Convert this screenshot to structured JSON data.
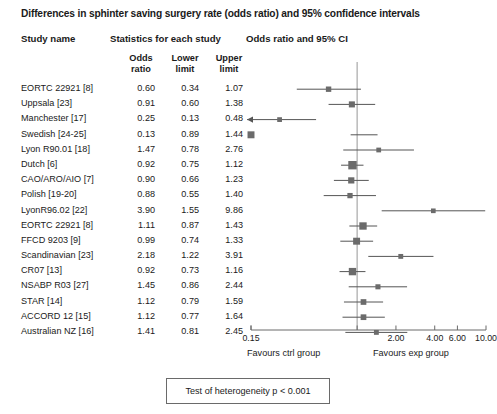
{
  "title": "Differences in sphinter saving surgery rate (odds ratio) and 95% confidence intervals",
  "headers": {
    "study_name": "Study name",
    "statistics": "Statistics for each study",
    "odds_ratio_ci": "Odds ratio and 95% CI",
    "odds_ratio": "Odds\nratio",
    "odds_ratio_l1": "Odds",
    "odds_ratio_l2": "ratio",
    "lower_limit_l1": "Lower",
    "lower_limit_l2": "limit",
    "upper_limit_l1": "Upper",
    "upper_limit_l2": "limit"
  },
  "axis": {
    "tick_labels": [
      "0.15",
      "1.00",
      "2.00",
      "4.00",
      "6.00",
      "10.00"
    ],
    "tick_values": [
      0.15,
      1.0,
      2.0,
      4.0,
      6.0,
      10.0
    ],
    "visible_tick_labels": [
      "0.15",
      "2.00",
      "4.00",
      "6.00",
      "10.00"
    ],
    "min": 0.15,
    "max": 10.0,
    "reference_line": 1.0,
    "favours_left": "Favours ctrl group",
    "favours_right": "Favours exp group"
  },
  "heterogeneity": {
    "text": "Test of heterogeneity p < 0.001"
  },
  "colors": {
    "marker": "#6b6b6b",
    "line": "#555555",
    "axis": "#6a6a6a",
    "reference": "#b5b5b5",
    "text": "#1a1a1a",
    "box_border": "#6a6a6a"
  },
  "chart_data": {
    "type": "forest",
    "title": "Differences in sphinter saving surgery rate (odds ratio) and 95% confidence intervals",
    "xlabel": "Odds ratio and 95% CI",
    "ylabel": "",
    "xscale": "log",
    "xlim": [
      0.15,
      10.0
    ],
    "reference_line": 1.0,
    "grid": false,
    "columns": [
      "Study name",
      "Odds ratio",
      "Lower limit",
      "Upper limit"
    ],
    "rows": [
      {
        "study": "EORTC 22921 [8]",
        "or": 0.6,
        "lower": 0.34,
        "upper": 1.07,
        "weight": 0.42,
        "clipped_left": false
      },
      {
        "study": "Uppsala [23]",
        "or": 0.91,
        "lower": 0.6,
        "upper": 1.38,
        "weight": 0.55,
        "clipped_left": false
      },
      {
        "study": "Manchester [17]",
        "or": 0.25,
        "lower": 0.13,
        "upper": 0.48,
        "weight": 0.3,
        "clipped_left": true
      },
      {
        "study": "Swedish [24-25]",
        "or": 0.13,
        "lower": 0.89,
        "upper": 1.44,
        "weight": 0.72,
        "clipped_left": false
      },
      {
        "study": "Lyon R90.01 [18]",
        "or": 1.47,
        "lower": 0.78,
        "upper": 2.76,
        "weight": 0.3,
        "clipped_left": false
      },
      {
        "study": "Dutch [6]",
        "or": 0.92,
        "lower": 0.75,
        "upper": 1.12,
        "weight": 1.0,
        "clipped_left": false
      },
      {
        "study": "CAO/ARO/AIO [7]",
        "or": 0.9,
        "lower": 0.66,
        "upper": 1.23,
        "weight": 0.58,
        "clipped_left": false
      },
      {
        "study": "Polish [19-20]",
        "or": 0.88,
        "lower": 0.55,
        "upper": 1.4,
        "weight": 0.4,
        "clipped_left": false
      },
      {
        "study": "LyonR96.02 [22]",
        "or": 3.9,
        "lower": 1.55,
        "upper": 9.86,
        "weight": 0.28,
        "clipped_left": false
      },
      {
        "study": "EORTC 22921 [8]",
        "or": 1.11,
        "lower": 0.87,
        "upper": 1.43,
        "weight": 0.8,
        "clipped_left": false
      },
      {
        "study": "FFCD 9203 [9]",
        "or": 0.99,
        "lower": 0.74,
        "upper": 1.33,
        "weight": 0.72,
        "clipped_left": false
      },
      {
        "study": "Scandinavian [23]",
        "or": 2.18,
        "lower": 1.22,
        "upper": 3.91,
        "weight": 0.32,
        "clipped_left": false
      },
      {
        "study": "CR07 [13]",
        "or": 0.92,
        "lower": 0.73,
        "upper": 1.16,
        "weight": 0.8,
        "clipped_left": false
      },
      {
        "study": "NSABP R03 [27]",
        "or": 1.45,
        "lower": 0.86,
        "upper": 2.44,
        "weight": 0.36,
        "clipped_left": false
      },
      {
        "study": "STAR [14]",
        "or": 1.12,
        "lower": 0.79,
        "upper": 1.59,
        "weight": 0.48,
        "clipped_left": false
      },
      {
        "study": "ACCORD 12 [15]",
        "or": 1.12,
        "lower": 0.77,
        "upper": 1.64,
        "weight": 0.48,
        "clipped_left": false
      },
      {
        "study": "Australian NZ [16]",
        "or": 1.41,
        "lower": 0.81,
        "upper": 2.45,
        "weight": 0.32,
        "clipped_left": false
      }
    ]
  }
}
